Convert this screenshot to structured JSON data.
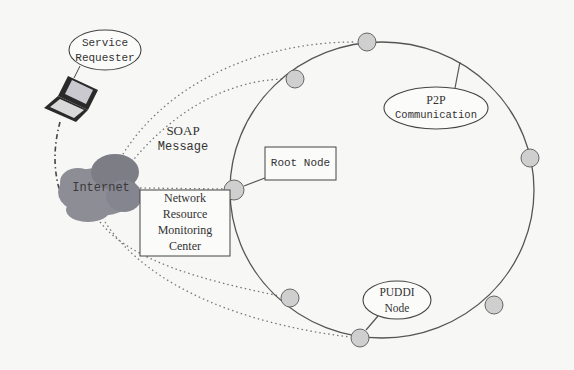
{
  "diagram": {
    "service_requester": {
      "line1": "Service",
      "line2": "Requester"
    },
    "soap": {
      "line1": "SOAP",
      "line2": "Message"
    },
    "internet": {
      "label": "Internet"
    },
    "root_node": {
      "label": "Root Node"
    },
    "monitoring_center": {
      "line1": "Network",
      "line2": "Resource",
      "line3": "Monitoring",
      "line4": "Center"
    },
    "p2p": {
      "line1": "P2P",
      "line2": "Communication"
    },
    "puddi": {
      "line1": "PUDDI",
      "line2": "Node"
    },
    "colors": {
      "ring_stroke": "#555555",
      "node_fill": "#cfcfcf",
      "cloud_fill": "#8d8d95",
      "cloud_dark": "#77777f",
      "dotted": "#777777"
    },
    "ring_nodes": [
      {
        "id": "top",
        "x": 367,
        "y": 42
      },
      {
        "id": "upper-left",
        "x": 295,
        "y": 79
      },
      {
        "id": "left",
        "x": 234,
        "y": 190
      },
      {
        "id": "right",
        "x": 530,
        "y": 158
      },
      {
        "id": "lower-right",
        "x": 494,
        "y": 305
      },
      {
        "id": "bottom",
        "x": 360,
        "y": 338
      },
      {
        "id": "lower-left",
        "x": 290,
        "y": 298
      }
    ]
  }
}
